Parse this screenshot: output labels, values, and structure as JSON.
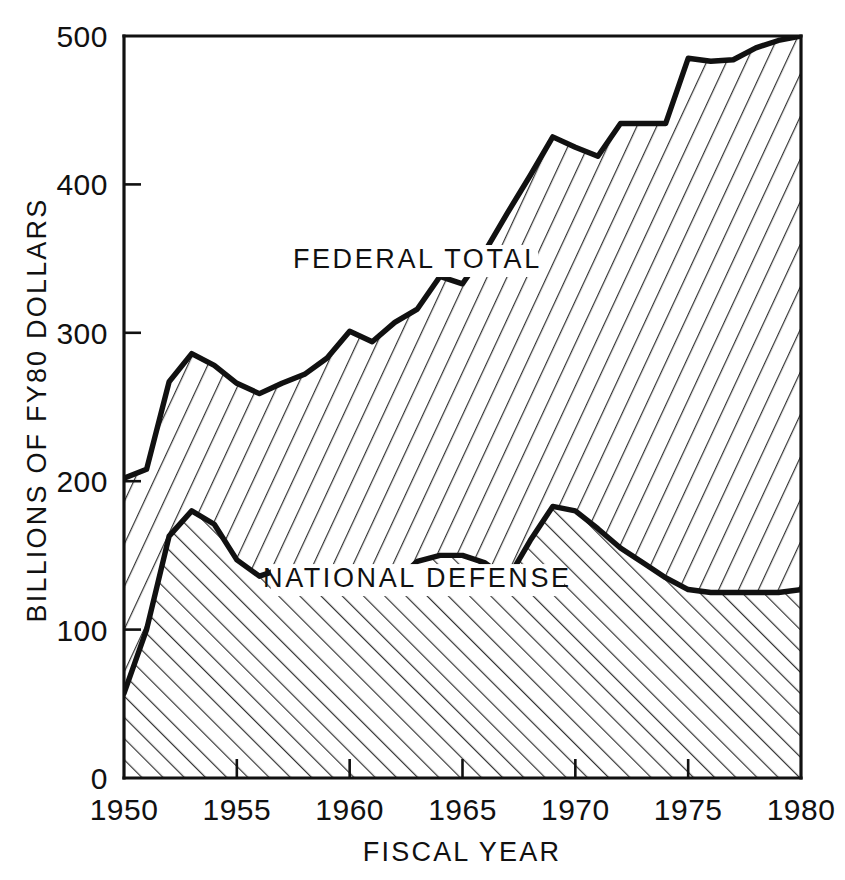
{
  "chart_data": {
    "type": "area",
    "title": "",
    "xlabel": "FISCAL YEAR",
    "ylabel": "BILLIONS OF FY80 DOLLARS",
    "xlim": [
      1950,
      1980
    ],
    "ylim": [
      0,
      500
    ],
    "xticks": [
      1950,
      1955,
      1960,
      1965,
      1970,
      1975,
      1980
    ],
    "xtick_labels": [
      "1950",
      "1955",
      "1960",
      "1965",
      "1970",
      "1975",
      "1980"
    ],
    "yticks": [
      0,
      100,
      200,
      300,
      400,
      500
    ],
    "ytick_labels": [
      "0",
      "100",
      "200",
      "300",
      "400",
      "500"
    ],
    "grid": false,
    "legend_position": "inline-annotations",
    "annotations": [
      {
        "text": "FEDERAL TOTAL",
        "x": 1963.0,
        "y": 345
      },
      {
        "text": "NATIONAL DEFENSE",
        "x": 1963.0,
        "y": 130
      }
    ],
    "x": [
      1950,
      1951,
      1952,
      1953,
      1954,
      1955,
      1956,
      1957,
      1958,
      1959,
      1960,
      1961,
      1962,
      1963,
      1964,
      1965,
      1966,
      1967,
      1968,
      1969,
      1970,
      1971,
      1972,
      1973,
      1974,
      1975,
      1976,
      1977,
      1978,
      1979,
      1980
    ],
    "series": [
      {
        "name": "FEDERAL TOTAL",
        "values": [
          202,
          208,
          267,
          286,
          278,
          266,
          259,
          266,
          272,
          283,
          301,
          294,
          307,
          316,
          338,
          333,
          355,
          381,
          406,
          432,
          425,
          419,
          441,
          441,
          441,
          485,
          483,
          484,
          492,
          497,
          500
        ]
      },
      {
        "name": "NATIONAL DEFENSE",
        "values": [
          57,
          100,
          163,
          180,
          171,
          147,
          136,
          141,
          141,
          141,
          140,
          139,
          132,
          146,
          150,
          150,
          145,
          134,
          160,
          183,
          180,
          168,
          155,
          145,
          135,
          127,
          125,
          125,
          125,
          125,
          127
        ]
      }
    ],
    "colors": {
      "line": "#111111",
      "background": "#ffffff",
      "hatch_upper": "#333333",
      "hatch_lower": "#333333"
    },
    "hatch": {
      "federal_total": "diagonal-down-right",
      "national_defense": "diagonal-up-right"
    }
  }
}
